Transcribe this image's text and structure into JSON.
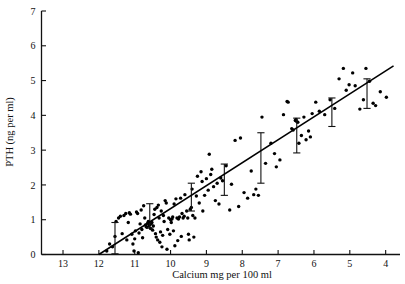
{
  "chart_data": {
    "type": "scatter",
    "title": "",
    "xlabel": "Calcium mg per 100 ml",
    "ylabel": "PTH (ng per ml)",
    "xlim": [
      13.6,
      3.6
    ],
    "ylim": [
      0,
      7
    ],
    "x_axis_reversed": true,
    "grid": false,
    "legend": "none",
    "xticks": [
      13,
      12,
      11,
      10,
      9,
      8,
      7,
      6,
      5,
      4
    ],
    "xtick_labels": [
      "13",
      "12",
      "11",
      "10",
      "9",
      "8",
      "7",
      "6",
      "5",
      "4"
    ],
    "yticks": [
      0,
      1,
      2,
      3,
      4,
      5,
      6,
      7
    ],
    "ytick_labels": [
      "0",
      "1",
      "2",
      "3",
      "4",
      "5",
      "6",
      "7"
    ],
    "regression_line": {
      "x_start": 12.0,
      "y_start": 0.0,
      "x_end": 3.78,
      "y_end": 5.42,
      "slope": -0.659,
      "intercept": 7.908
    },
    "error_bars": [
      {
        "x": 11.55,
        "low": 0.02,
        "high": 0.92,
        "center": 0.47
      },
      {
        "x": 10.58,
        "low": 0.76,
        "high": 1.46,
        "center": 1.11
      },
      {
        "x": 9.42,
        "low": 1.25,
        "high": 2.05,
        "center": 1.65
      },
      {
        "x": 8.5,
        "low": 1.7,
        "high": 2.6,
        "center": 2.15
      },
      {
        "x": 7.48,
        "low": 2.05,
        "high": 3.5,
        "center": 2.78
      },
      {
        "x": 6.48,
        "low": 2.92,
        "high": 3.92,
        "center": 3.42
      },
      {
        "x": 5.5,
        "low": 3.68,
        "high": 4.5,
        "center": 4.09
      },
      {
        "x": 4.52,
        "low": 4.2,
        "high": 5.05,
        "center": 4.62
      }
    ],
    "points": [
      [
        11.78,
        0.1
      ],
      [
        11.7,
        0.3
      ],
      [
        11.62,
        0.22
      ],
      [
        11.55,
        0.52
      ],
      [
        11.52,
        0.95
      ],
      [
        11.45,
        1.05
      ],
      [
        11.4,
        1.1
      ],
      [
        11.35,
        0.6
      ],
      [
        11.3,
        1.12
      ],
      [
        11.25,
        1.18
      ],
      [
        11.22,
        0.42
      ],
      [
        11.18,
        0.92
      ],
      [
        11.15,
        1.2
      ],
      [
        11.12,
        1.16
      ],
      [
        11.08,
        0.58
      ],
      [
        11.05,
        0.3
      ],
      [
        11.02,
        0.1
      ],
      [
        11.0,
        0.45
      ],
      [
        10.98,
        0.68
      ],
      [
        10.95,
        1.22
      ],
      [
        10.92,
        1.18
      ],
      [
        10.9,
        0.05
      ],
      [
        10.88,
        0.62
      ],
      [
        10.85,
        0.88
      ],
      [
        10.82,
        1.28
      ],
      [
        10.8,
        0.72
      ],
      [
        10.78,
        0.48
      ],
      [
        10.75,
        1.4
      ],
      [
        10.72,
        1.05
      ],
      [
        10.7,
        0.85
      ],
      [
        10.68,
        0.8
      ],
      [
        10.66,
        0.78
      ],
      [
        10.64,
        0.9
      ],
      [
        10.62,
        0.95
      ],
      [
        10.6,
        0.83
      ],
      [
        10.58,
        0.86
      ],
      [
        10.56,
        0.75
      ],
      [
        10.54,
        0.88
      ],
      [
        10.52,
        0.92
      ],
      [
        10.5,
        0.7
      ],
      [
        10.48,
        0.82
      ],
      [
        10.46,
        1.15
      ],
      [
        10.44,
        1.3
      ],
      [
        10.42,
        0.6
      ],
      [
        10.4,
        0.5
      ],
      [
        10.38,
        1.35
      ],
      [
        10.36,
        0.42
      ],
      [
        10.34,
        1.42
      ],
      [
        10.32,
        1.05
      ],
      [
        10.3,
        0.35
      ],
      [
        10.28,
        0.65
      ],
      [
        10.26,
        1.25
      ],
      [
        10.24,
        0.22
      ],
      [
        10.22,
        0.55
      ],
      [
        10.2,
        1.12
      ],
      [
        10.18,
        0.95
      ],
      [
        10.15,
        1.55
      ],
      [
        10.12,
        1.48
      ],
      [
        10.1,
        0.15
      ],
      [
        10.08,
        0.72
      ],
      [
        10.05,
        1.05
      ],
      [
        10.02,
        0.58
      ],
      [
        10.0,
        1.0
      ],
      [
        9.98,
        0.92
      ],
      [
        9.96,
        1.02
      ],
      [
        9.94,
        1.08
      ],
      [
        9.92,
        0.68
      ],
      [
        9.9,
        1.45
      ],
      [
        9.88,
        0.25
      ],
      [
        9.85,
        1.6
      ],
      [
        9.82,
        1.05
      ],
      [
        9.8,
        0.4
      ],
      [
        9.78,
        1.02
      ],
      [
        9.75,
        1.08
      ],
      [
        9.72,
        1.62
      ],
      [
        9.7,
        0.52
      ],
      [
        9.68,
        1.18
      ],
      [
        9.65,
        1.05
      ],
      [
        9.62,
        1.1
      ],
      [
        9.6,
        1.72
      ],
      [
        9.55,
        1.25
      ],
      [
        9.52,
        1.05
      ],
      [
        9.5,
        0.58
      ],
      [
        9.48,
        0.42
      ],
      [
        9.45,
        1.3
      ],
      [
        9.42,
        1.35
      ],
      [
        9.4,
        1.88
      ],
      [
        9.38,
        1.12
      ],
      [
        9.35,
        0.5
      ],
      [
        9.32,
        1.05
      ],
      [
        9.28,
        1.68
      ],
      [
        9.25,
        2.25
      ],
      [
        9.2,
        1.48
      ],
      [
        9.15,
        2.38
      ],
      [
        9.12,
        2.1
      ],
      [
        9.1,
        1.25
      ],
      [
        9.05,
        1.7
      ],
      [
        9.0,
        2.18
      ],
      [
        8.95,
        1.85
      ],
      [
        8.92,
        2.88
      ],
      [
        8.88,
        2.3
      ],
      [
        8.85,
        2.45
      ],
      [
        8.8,
        1.95
      ],
      [
        8.75,
        1.55
      ],
      [
        8.7,
        2.05
      ],
      [
        8.65,
        1.45
      ],
      [
        8.6,
        2.2
      ],
      [
        8.55,
        2.12
      ],
      [
        8.45,
        2.55
      ],
      [
        8.35,
        1.28
      ],
      [
        8.3,
        2.02
      ],
      [
        8.2,
        3.28
      ],
      [
        8.1,
        1.38
      ],
      [
        8.05,
        3.35
      ],
      [
        7.95,
        1.78
      ],
      [
        7.85,
        1.62
      ],
      [
        7.75,
        2.4
      ],
      [
        7.68,
        1.72
      ],
      [
        7.62,
        1.88
      ],
      [
        7.55,
        1.7
      ],
      [
        7.45,
        3.95
      ],
      [
        7.35,
        2.62
      ],
      [
        7.2,
        3.2
      ],
      [
        7.1,
        2.9
      ],
      [
        7.05,
        2.52
      ],
      [
        6.95,
        2.72
      ],
      [
        6.85,
        4.02
      ],
      [
        6.75,
        4.4
      ],
      [
        6.72,
        4.38
      ],
      [
        6.62,
        3.62
      ],
      [
        6.58,
        3.58
      ],
      [
        6.52,
        3.85
      ],
      [
        6.5,
        3.88
      ],
      [
        6.48,
        3.82
      ],
      [
        6.45,
        3.8
      ],
      [
        6.42,
        3.2
      ],
      [
        6.35,
        3.42
      ],
      [
        6.28,
        3.95
      ],
      [
        6.22,
        3.3
      ],
      [
        6.15,
        3.55
      ],
      [
        6.1,
        3.38
      ],
      [
        6.05,
        4.05
      ],
      [
        5.95,
        4.38
      ],
      [
        5.85,
        4.12
      ],
      [
        5.7,
        4.02
      ],
      [
        5.55,
        4.45
      ],
      [
        5.42,
        4.2
      ],
      [
        5.3,
        5.05
      ],
      [
        5.18,
        5.35
      ],
      [
        5.1,
        4.72
      ],
      [
        5.02,
        4.88
      ],
      [
        4.92,
        5.22
      ],
      [
        4.85,
        4.85
      ],
      [
        4.72,
        4.18
      ],
      [
        4.62,
        4.45
      ],
      [
        4.55,
        5.35
      ],
      [
        4.45,
        4.98
      ],
      [
        4.35,
        4.35
      ],
      [
        4.28,
        4.28
      ],
      [
        4.15,
        4.68
      ],
      [
        3.98,
        4.52
      ]
    ]
  },
  "axes": {
    "x_tick_label_values": [
      "13",
      "12",
      "11",
      "10",
      "9",
      "8",
      "7",
      "6",
      "5",
      "4"
    ],
    "y_tick_label_values": [
      "0",
      "1",
      "2",
      "3",
      "4",
      "5",
      "6",
      "7"
    ]
  }
}
